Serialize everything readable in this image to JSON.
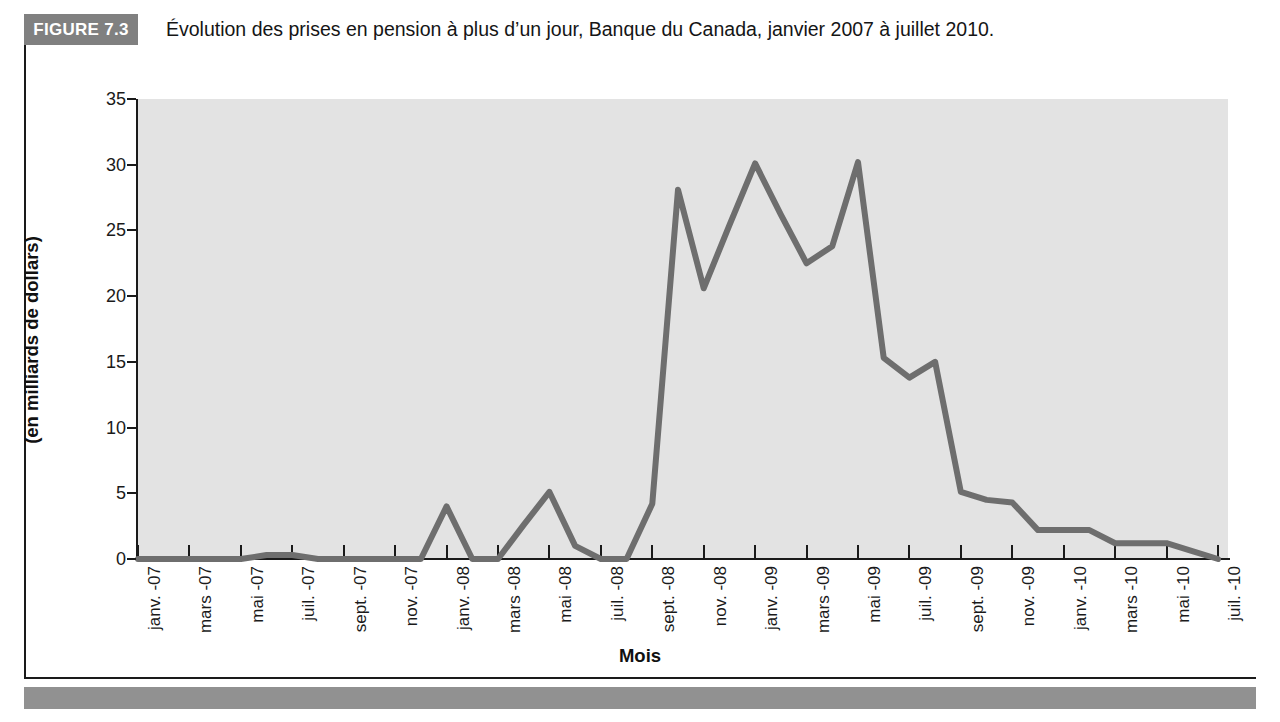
{
  "figure": {
    "badge": "FIGURE 7.3",
    "title": "Évolution des prises en pension à plus d’un jour, Banque du Canada, janvier 2007 à juillet 2010."
  },
  "colors": {
    "badge_background": "#808080",
    "plot_background": "#e3e3e3",
    "line": "#6e6e6e",
    "axis": "#1a1a1a",
    "footer_bar": "#919191"
  },
  "chart_data": {
    "type": "line",
    "title": "Évolution des prises en pension à plus d’un jour, Banque du Canada, janvier 2007 à juillet 2010.",
    "xlabel": "Mois",
    "ylabel": "(en milliards de dollars)",
    "ylim": [
      0,
      35
    ],
    "yticks": [
      0,
      5,
      10,
      15,
      20,
      25,
      30,
      35
    ],
    "grid": false,
    "legend": "none",
    "series_name": "Prises en pension à plus d’un jour",
    "x_tick_labels": [
      "janv. -07",
      "mars -07",
      "mai -07",
      "juil. -07",
      "sept. -07",
      "nov. -07",
      "janv. -08",
      "mars -08",
      "mai -08",
      "juil. -08",
      "sept. -08",
      "nov. -08",
      "janv. -09",
      "mars -09",
      "mai -09",
      "juil. -09",
      "sept. -09",
      "nov. -09",
      "janv. -10",
      "mars -10",
      "mai -10",
      "juil. -10"
    ],
    "x": [
      "janv. -07",
      "févr. -07",
      "mars -07",
      "avr. -07",
      "mai -07",
      "juin -07",
      "juil. -07",
      "août -07",
      "sept. -07",
      "oct. -07",
      "nov. -07",
      "déc. -07",
      "janv. -08",
      "févr. -08",
      "mars -08",
      "avr. -08",
      "mai -08",
      "juin -08",
      "juil. -08",
      "août -08",
      "sept. -08",
      "oct. -08",
      "nov. -08",
      "déc. -08",
      "janv. -09",
      "févr. -09",
      "mars -09",
      "avr. -09",
      "mai -09",
      "juin -09",
      "juil. -09",
      "août -09",
      "sept. -09",
      "oct. -09",
      "nov. -09",
      "déc. -09",
      "janv. -10",
      "févr. -10",
      "mars -10",
      "avr. -10",
      "mai -10",
      "juin -10",
      "juil. -10"
    ],
    "values": [
      0,
      0,
      0,
      0,
      0,
      0.3,
      0.3,
      0,
      0,
      0,
      0,
      0,
      4.0,
      0,
      0,
      2.6,
      5.1,
      1.0,
      0,
      0,
      4.2,
      28.1,
      20.6,
      25.4,
      30.1,
      26.2,
      22.5,
      23.8,
      30.2,
      15.3,
      13.8,
      15.0,
      5.1,
      4.5,
      4.3,
      2.2,
      2.2,
      2.2,
      1.2,
      1.2,
      1.2,
      0.6,
      0
    ]
  }
}
